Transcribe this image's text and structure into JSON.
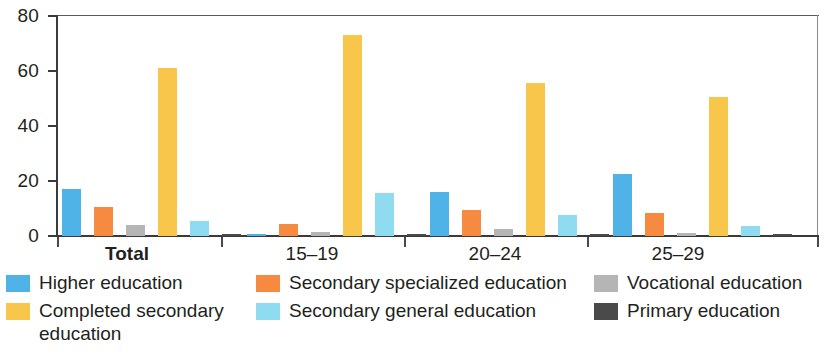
{
  "chart_data": {
    "type": "bar",
    "title": "",
    "subtitle": "",
    "xlabel": "",
    "ylabel": "",
    "ylim": [
      0,
      80
    ],
    "yticks": [
      0,
      20,
      40,
      60,
      80
    ],
    "ytick_labels": [
      "0",
      "20",
      "40",
      "60",
      "80"
    ],
    "grid": false,
    "legend_position": "bottom",
    "categories": [
      "Total",
      "15–19",
      "20–24",
      "25–29"
    ],
    "series": [
      {
        "name": "Higher education",
        "color": "#4fb3e8",
        "values": [
          17.0,
          0.2,
          16.0,
          22.5
        ]
      },
      {
        "name": "Secondary specialized education",
        "color": "#f58a40",
        "values": [
          10.5,
          4.5,
          9.5,
          8.5
        ]
      },
      {
        "name": "Vocational education",
        "color": "#b5b5b5",
        "values": [
          4.0,
          1.5,
          2.5,
          1.2
        ]
      },
      {
        "name": "Completed secondary education",
        "color": "#f7c64b",
        "values": [
          61.0,
          73.0,
          55.5,
          50.5
        ]
      },
      {
        "name": "Secondary general education",
        "color": "#8fdcf0",
        "values": [
          5.5,
          15.5,
          7.5,
          3.5
        ]
      },
      {
        "name": "Primary education",
        "color": "#4a4a4a",
        "values": [
          0.3,
          0.3,
          0.3,
          0.3
        ]
      }
    ]
  },
  "axis": {
    "y_tick_labels": [
      "80",
      "60",
      "40",
      "20",
      "0"
    ],
    "x_categories": [
      {
        "label": "Total",
        "bold": true
      },
      {
        "label": "15–19",
        "bold": false
      },
      {
        "label": "20–24",
        "bold": false
      },
      {
        "label": "25–29",
        "bold": false
      }
    ]
  },
  "legend": {
    "columns": [
      {
        "items": [
          {
            "label": "Higher education",
            "color": "#4fb3e8"
          },
          {
            "label": "Completed secondary education",
            "color": "#f7c64b"
          }
        ]
      },
      {
        "items": [
          {
            "label": "Secondary specialized education",
            "color": "#f58a40"
          },
          {
            "label": "Secondary general education",
            "color": "#8fdcf0"
          }
        ]
      },
      {
        "items": [
          {
            "label": "Vocational education",
            "color": "#b5b5b5"
          },
          {
            "label": "Primary education",
            "color": "#4a4a4a"
          }
        ]
      }
    ]
  }
}
